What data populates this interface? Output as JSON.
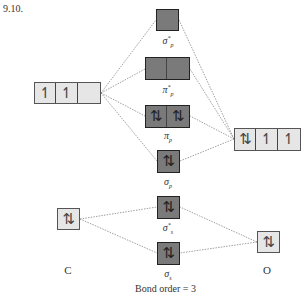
{
  "problem_number": "9.10.",
  "colors": {
    "atomic_orbital_fill": "#e6e6e6",
    "molecular_orbital_fill": "#7a7a7a",
    "connector_line": "#777777"
  },
  "atoms": {
    "left": {
      "label": "C",
      "orbitals": [
        {
          "name": "2p",
          "cells": [
            "↿",
            "↿",
            ""
          ]
        },
        {
          "name": "2s",
          "cells": [
            "⇅"
          ]
        }
      ]
    },
    "right": {
      "label": "O",
      "orbitals": [
        {
          "name": "2p",
          "cells": [
            "⇅",
            "↿",
            "↿"
          ]
        },
        {
          "name": "2s",
          "cells": [
            "⇅"
          ]
        }
      ]
    }
  },
  "molecular_orbitals": [
    {
      "id": "sigma_star_p",
      "symbol": "σ",
      "sup": "*",
      "sub": "p",
      "cells": [
        ""
      ]
    },
    {
      "id": "pi_star_p",
      "symbol": "π",
      "sup": "*",
      "sub": "p",
      "cells": [
        "",
        ""
      ]
    },
    {
      "id": "pi_p",
      "symbol": "π",
      "sup": "",
      "sub": "p",
      "cells": [
        "⇅",
        "⇅"
      ]
    },
    {
      "id": "sigma_p",
      "symbol": "σ",
      "sup": "",
      "sub": "p",
      "cells": [
        "⇅"
      ]
    },
    {
      "id": "sigma_star_s",
      "symbol": "σ",
      "sup": "*",
      "sub": "s",
      "cells": [
        "⇅"
      ]
    },
    {
      "id": "sigma_s",
      "symbol": "σ",
      "sup": "",
      "sub": "s",
      "cells": [
        "⇅"
      ]
    }
  ],
  "footer": {
    "bond_order": "Bond order = 3"
  }
}
